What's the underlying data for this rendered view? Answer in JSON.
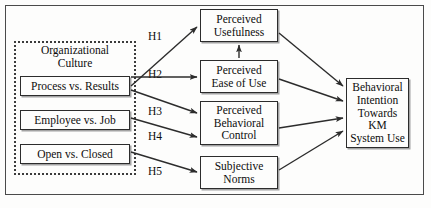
{
  "figure": {
    "group": {
      "caption": "Organizational\nCulture"
    },
    "nodes": {
      "process_vs_results": "Process vs. Results",
      "employee_vs_job": "Employee vs. Job",
      "open_vs_closed": "Open vs. Closed",
      "perceived_usefulness": "Perceived\nUsefulness",
      "perceived_ease_of_use": "Perceived\nEase of Use",
      "perceived_behavioral_control": "Perceived\nBehavioral\nControl",
      "subjective_norms": "Subjective\nNorms",
      "behavioral_intention": "Behavioral\nIntention\nTowards\nKM\nSystem Use"
    },
    "hypotheses": {
      "h1": "H1",
      "h2": "H2",
      "h3": "H3",
      "h4": "H4",
      "h5": "H5"
    },
    "colors": {
      "line": "#2c2c2c",
      "frame": "#4a4a4a",
      "dotted_group": "#3b3b3b",
      "background": "#fdfdfc",
      "text": "#0d0d0d"
    }
  }
}
